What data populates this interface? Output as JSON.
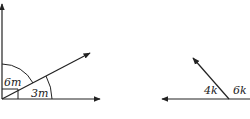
{
  "figures": [
    {
      "id": "left",
      "description": "Right angle split by a ray into two adjacent angles",
      "angles": [
        {
          "label": "6m",
          "position": "upper (between vertical ray and diagonal ray)"
        },
        {
          "label": "3m",
          "position": "lower (between diagonal ray and horizontal ray)"
        }
      ],
      "right_angle_marked": true
    },
    {
      "id": "right",
      "description": "Straight line with a ray forming two adjacent (linear pair) angles",
      "angles": [
        {
          "label": "4k",
          "position": "left"
        },
        {
          "label": "6k",
          "position": "right"
        }
      ]
    }
  ],
  "colors": {
    "stroke": "#222222",
    "background": "#ffffff"
  }
}
